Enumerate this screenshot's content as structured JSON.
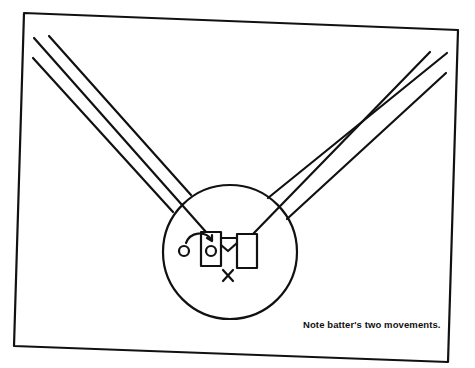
{
  "diagram": {
    "caption": "Note batter's two movements.",
    "labels": {
      "batter_start": "O",
      "batter_end": "O",
      "catcher": "X"
    },
    "colors": {
      "ink": "#111111",
      "background": "#ffffff"
    }
  }
}
